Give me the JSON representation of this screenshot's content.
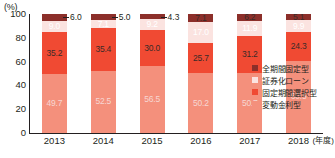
{
  "chart_data": {
    "type": "bar",
    "stacked": true,
    "stack_mode": "percent",
    "title": "",
    "subtitle": "",
    "xlabel": "年度",
    "ylabel": "%",
    "y_unit_label": "(%)",
    "x_unit_label": "(年度)",
    "ylim": [
      0,
      100
    ],
    "yticks": [
      0,
      20,
      40,
      60,
      80,
      100
    ],
    "ytick_labels": [
      "0",
      "20",
      "40",
      "60",
      "80",
      "100"
    ],
    "grid": false,
    "legend_position": "right-bottom",
    "categories": [
      "2013",
      "2014",
      "2015",
      "2016",
      "2017",
      "2018"
    ],
    "series": [
      {
        "name": "変動金利型",
        "color": "#f4907c",
        "values": [
          49.7,
          52.5,
          56.5,
          50.2,
          50.7,
          60.5
        ],
        "labels": [
          "49.7",
          "52.5",
          "56.5",
          "50.2",
          "50.7",
          "60.5"
        ]
      },
      {
        "name": "固定期間選択型",
        "color": "#f04a33",
        "values": [
          35.2,
          35.4,
          30.0,
          25.7,
          31.2,
          24.3
        ],
        "labels": [
          "35.2",
          "35.4",
          "30.0",
          "25.7",
          "31.2",
          "24.3"
        ]
      },
      {
        "name": "証券化ローン",
        "color": "#fbe3e0",
        "values": [
          9.0,
          7.1,
          9.2,
          17.0,
          11.9,
          9.9
        ],
        "labels": [
          "9.0",
          "7.1",
          "9.2",
          "17.0",
          "11.9",
          "9.9"
        ]
      },
      {
        "name": "全期間固定型",
        "color": "#8c2f2a",
        "values": [
          6.0,
          5.0,
          4.3,
          7.1,
          6.2,
          5.1
        ],
        "labels": [
          "6.0",
          "5.0",
          "4.3",
          "7.1",
          "6.2",
          "5.1"
        ]
      }
    ],
    "callouts": [
      {
        "category": "2013",
        "text": "6.0"
      },
      {
        "category": "2014",
        "text": "5.0"
      },
      {
        "category": "2015",
        "text": "4.3"
      }
    ]
  },
  "legend": {
    "items": [
      {
        "label": "全期間固定型",
        "color": "#8c2f2a"
      },
      {
        "label": "証券化ローン",
        "color": "#fbe3e0"
      },
      {
        "label": "固定期間選択型",
        "color": "#f04a33"
      },
      {
        "label": "変動金利型",
        "color": "#f4907c"
      }
    ]
  }
}
